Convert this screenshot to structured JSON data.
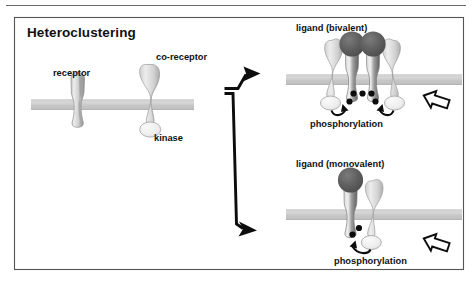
{
  "figure": {
    "title": "Heteroclustering",
    "top_rule": true,
    "frame": {
      "border_color": "#555555",
      "background": "#ffffff"
    }
  },
  "colors": {
    "membrane": "#c9c9c9",
    "membrane_edge": "#bdbdbd",
    "receptor_light": "#d8d8d8",
    "receptor_mid": "#b4b4b4",
    "receptor_dark": "#6e6e6e",
    "coreceptor": "#d2d2d2",
    "kinase_fill": "#ececec",
    "ligand_dark": "#585858",
    "outline": "#8a8a8a",
    "ink": "#111111"
  },
  "left_panel": {
    "name": "unclustered-state",
    "labels": {
      "receptor": "receptor",
      "coreceptor": "co-receptor",
      "kinase": "kinase"
    }
  },
  "connector": {
    "name": "branching-arrow",
    "arrow_count": 2,
    "directions": [
      "up-right",
      "down-right"
    ]
  },
  "top_right_panel": {
    "name": "bivalent-ligand-cluster",
    "ligand_label": "ligand (bivalent)",
    "phosphorylation_label": "phosphorylation",
    "ligand_circles": 2,
    "receptors": 2,
    "coreceptors": 2,
    "kinases": 2,
    "phosphate_dots": 5,
    "phospho_arrows": 2,
    "outcome_arrow": "hollow-right-arrow"
  },
  "bottom_right_panel": {
    "name": "monovalent-ligand-cluster",
    "ligand_label": "ligand (monovalent)",
    "phosphorylation_label": "phosphorylation",
    "ligand_circles": 1,
    "receptors": 1,
    "coreceptors": 1,
    "kinases": 1,
    "phosphate_dots": 2,
    "phospho_arrows": 1,
    "outcome_arrow": "hollow-right-arrow"
  }
}
